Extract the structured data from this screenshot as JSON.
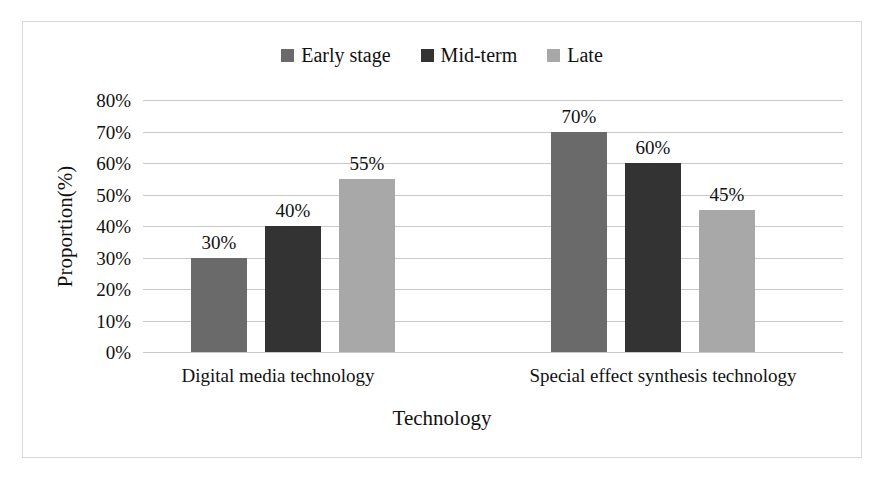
{
  "chart_data": {
    "type": "bar",
    "title": "",
    "subtitle": "",
    "xlabel": "Technology",
    "ylabel": "Proportion(%)",
    "categories": [
      "Digital media technology",
      "Special effect synthesis technology"
    ],
    "series": [
      {
        "name": "Early stage",
        "color": "#6a6a6a",
        "values": [
          30,
          40
        ],
        "labels": [
          "30%",
          "70%"
        ]
      },
      {
        "name": "Mid-term",
        "color": "#333333",
        "values": [
          40,
          60
        ],
        "labels": [
          "40%",
          "60%"
        ]
      },
      {
        "name": "Late",
        "color": "#a8a8a8",
        "values": [
          55,
          45
        ],
        "labels": [
          "55%",
          "45%"
        ]
      }
    ],
    "bars": [
      {
        "category": "Digital media technology",
        "series": "Early stage",
        "value": 30,
        "label": "30%"
      },
      {
        "category": "Digital media technology",
        "series": "Mid-term",
        "value": 40,
        "label": "40%"
      },
      {
        "category": "Digital media technology",
        "series": "Late",
        "value": 55,
        "label": "55%"
      },
      {
        "category": "Special effect synthesis technology",
        "series": "Early stage",
        "value": 70,
        "label": "70%"
      },
      {
        "category": "Special effect synthesis technology",
        "series": "Mid-term",
        "value": 60,
        "label": "60%"
      },
      {
        "category": "Special effect synthesis technology",
        "series": "Late",
        "value": 45,
        "label": "45%"
      }
    ],
    "ylim": [
      0,
      80
    ],
    "ytick_step": 10,
    "ytick_labels": [
      "80%",
      "70%",
      "60%",
      "50%",
      "40%",
      "30%",
      "20%",
      "10%",
      "0%"
    ],
    "ytick_values": [
      80,
      70,
      60,
      50,
      40,
      30,
      20,
      10,
      0
    ],
    "grid": "horizontal",
    "legend_position": "top-center",
    "gridline_color": "#c9c9c9",
    "background_color": "#ffffff",
    "border_color": "#d8d8d8"
  },
  "legend": {
    "items": [
      {
        "label": "Early stage",
        "color": "#6a6a6a"
      },
      {
        "label": "Mid-term",
        "color": "#333333"
      },
      {
        "label": "Late",
        "color": "#a8a8a8"
      }
    ]
  },
  "axes": {
    "y_title": "Proportion(%)",
    "x_title": "Technology"
  }
}
